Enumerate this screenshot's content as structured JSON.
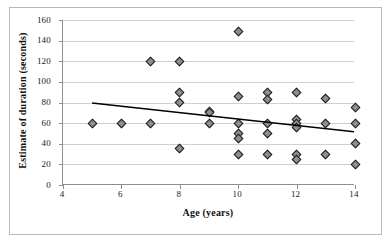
{
  "chart_data": {
    "type": "scatter",
    "title": "",
    "xlabel": "Age (years)",
    "ylabel": "Estimate of duration (seconds)",
    "xlim": [
      4,
      14
    ],
    "ylim": [
      0,
      160
    ],
    "xticks": [
      4,
      6,
      8,
      10,
      12,
      14
    ],
    "yticks": [
      0,
      20,
      40,
      60,
      80,
      100,
      120,
      140,
      160
    ],
    "grid": "horizontal",
    "legend": "none",
    "marker": "diamond",
    "marker_fill": "#8e8e8e",
    "marker_edge": "#1d1d1d",
    "points": [
      {
        "x": 5,
        "y": 60
      },
      {
        "x": 6,
        "y": 60
      },
      {
        "x": 7,
        "y": 60
      },
      {
        "x": 7,
        "y": 120
      },
      {
        "x": 8,
        "y": 120
      },
      {
        "x": 8,
        "y": 90
      },
      {
        "x": 8,
        "y": 80
      },
      {
        "x": 8,
        "y": 35
      },
      {
        "x": 9,
        "y": 71
      },
      {
        "x": 9,
        "y": 70
      },
      {
        "x": 9,
        "y": 60
      },
      {
        "x": 10,
        "y": 149
      },
      {
        "x": 10,
        "y": 86
      },
      {
        "x": 10,
        "y": 60
      },
      {
        "x": 10,
        "y": 50
      },
      {
        "x": 10,
        "y": 45
      },
      {
        "x": 10,
        "y": 30
      },
      {
        "x": 11,
        "y": 90
      },
      {
        "x": 11,
        "y": 83
      },
      {
        "x": 11,
        "y": 60
      },
      {
        "x": 11,
        "y": 50
      },
      {
        "x": 11,
        "y": 30
      },
      {
        "x": 12,
        "y": 90
      },
      {
        "x": 12,
        "y": 64
      },
      {
        "x": 12,
        "y": 60
      },
      {
        "x": 12,
        "y": 56
      },
      {
        "x": 12,
        "y": 30
      },
      {
        "x": 12,
        "y": 25
      },
      {
        "x": 13,
        "y": 84
      },
      {
        "x": 13,
        "y": 60
      },
      {
        "x": 13,
        "y": 30
      },
      {
        "x": 14,
        "y": 75
      },
      {
        "x": 14,
        "y": 60
      },
      {
        "x": 14,
        "y": 40
      },
      {
        "x": 14,
        "y": 20
      }
    ],
    "trendline": {
      "type": "linear",
      "x_start": 5,
      "y_start": 79,
      "x_end": 14,
      "y_end": 51,
      "color": "#000000"
    },
    "colors": {
      "axis": "#8d8d8d",
      "grid": "#d0d0d0",
      "frame": "#b9b9b9",
      "text": "#111111",
      "background": "#ffffff"
    }
  }
}
